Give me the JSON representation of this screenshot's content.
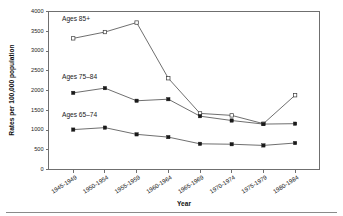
{
  "chart_data": {
    "type": "line",
    "title": "",
    "xlabel": "Year",
    "ylabel": "Rates per 100,000 population",
    "categories": [
      "1945-1949",
      "1950-1954",
      "1955-1959",
      "1960-1964",
      "1965-1969",
      "1970-1974",
      "1975-1979",
      "1980-1984"
    ],
    "ylim": [
      0,
      4000
    ],
    "yticks": [
      "0",
      "500",
      "1000",
      "1500",
      "2000",
      "2500",
      "3000",
      "3500",
      "4000"
    ],
    "ytick_values": [
      0,
      500,
      1000,
      1500,
      2000,
      2500,
      3000,
      3500,
      4000
    ],
    "grid": false,
    "legend_position": "inline-labels",
    "series": [
      {
        "name": "Ages 85+",
        "label": "Ages 85+",
        "marker": "open-square",
        "values": [
          3320,
          3480,
          3720,
          2310,
          1420,
          1370,
          1160,
          1880
        ]
      },
      {
        "name": "Ages 75-84",
        "label": "Ages 75–84",
        "marker": "filled-square",
        "values": [
          1940,
          2060,
          1740,
          1780,
          1350,
          1240,
          1150,
          1160
        ]
      },
      {
        "name": "Ages 65-74",
        "label": "Ages 65–74",
        "marker": "filled-square",
        "values": [
          1010,
          1060,
          890,
          820,
          650,
          640,
          610,
          670
        ]
      }
    ],
    "series_label_positions": [
      {
        "x": 62,
        "y": 21
      },
      {
        "x": 62,
        "y": 79
      },
      {
        "x": 62,
        "y": 117
      }
    ],
    "colors": {
      "line": "#4a4a4a",
      "axis": "#6f6f6f",
      "text": "#1a1a1a",
      "background": "#ffffff"
    }
  },
  "footer": {
    "rule_visible": "true"
  }
}
